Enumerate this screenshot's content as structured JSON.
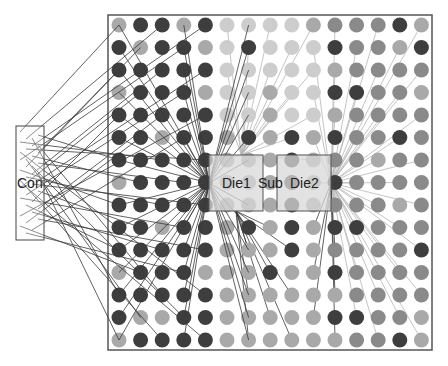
{
  "labels": {
    "connector": "Con",
    "die1": "Die1",
    "substrate": "Sub",
    "die2": "Die2"
  },
  "colors": {
    "D": "#3e3e3e",
    "M": "#8a8a8a",
    "L": "#a9a9a9",
    "P": "#cdcdcd",
    "frame": "#555555",
    "wire_dark": "#3a3a3a",
    "wire_light": "#b5b5b5"
  },
  "grid": {
    "x0": 119,
    "dx": 21.6,
    "y0": 25,
    "dy": 22.5,
    "radius": 7.5,
    "rows": [
      "LDDLDPPPPLMMMDL",
      "DLDDLPDPPPDMMLD",
      "DDDDDPPPPPLMMMM",
      "LDDDLPPLPPDDMML",
      "DDDDDPPLPPLMMMM",
      "DDLDDLDLDLDMMDM",
      "DDDDDLLLDLMMLMM",
      "LDDDDLLLDLDMMMM",
      "DDDDDLLLDLMMMLM",
      "DDLDDLDLDLDDMMM",
      "DDDDDLLLDLMMMMD",
      "LDDDLLLDLLDMMMM",
      "DDDDDLLLLLLMMMM",
      "DLLDDLLLLLDDMML",
      "LDDDDLLLLLLMMDL"
    ]
  },
  "frame": {
    "x": 108,
    "y": 15,
    "w": 324,
    "h": 335
  },
  "connector_box": {
    "x": 16,
    "y": 126,
    "w": 28,
    "h": 114
  },
  "die1_box": {
    "x": 209,
    "y": 155,
    "w": 54,
    "h": 56
  },
  "die2_box": {
    "x": 277,
    "y": 155,
    "w": 54,
    "h": 56
  }
}
